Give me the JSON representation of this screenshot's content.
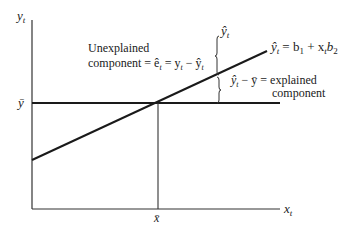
{
  "diagram": {
    "axes": {
      "y_label": "y",
      "y_label_sub": "t",
      "x_label": "x",
      "x_label_sub": "t"
    },
    "reference": {
      "ybar_label": "ȳ",
      "xbar_label": "x̄"
    },
    "regression_line": {
      "label_lhs": "ŷ",
      "label_lhs_sub": "t",
      "label_rhs": "= b",
      "label_rhs_sub1": "1",
      "label_rhs_mid": " + x",
      "label_rhs_sub2": "t",
      "label_rhs_end": "b",
      "label_rhs_sub3": "2"
    },
    "brace_top_label": "ŷ",
    "brace_top_label_sub": "t",
    "unexplained": {
      "line1": "Unexplained",
      "line2_pre": "component = ê",
      "line2_sub1": "t",
      "line2_mid": " = y",
      "line2_sub2": "t",
      "line2_mid2": " − ŷ",
      "line2_sub3": "t"
    },
    "explained": {
      "line1_pre": "ŷ",
      "line1_sub1": "t",
      "line1_mid": " − ȳ = explained",
      "line2": "component"
    },
    "colors": {
      "line": "#1a1a1a",
      "background": "#ffffff"
    }
  }
}
